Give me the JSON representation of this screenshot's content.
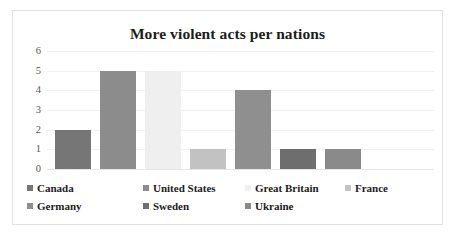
{
  "chart_data": {
    "type": "bar",
    "title": "More violent acts per nations",
    "xlabel": "",
    "ylabel": "",
    "categories": [
      "1"
    ],
    "xtick_labels": [
      "1"
    ],
    "ytick_labels": [
      "6",
      "5",
      "4",
      "3",
      "2",
      "1",
      "0"
    ],
    "ylim": [
      0,
      6
    ],
    "grid": true,
    "legend_position": "bottom",
    "series": [
      {
        "name": "Canada",
        "values": [
          2
        ],
        "color": "#767676"
      },
      {
        "name": "United States",
        "values": [
          5
        ],
        "color": "#8c8c8c"
      },
      {
        "name": "Great Britain",
        "values": [
          5
        ],
        "color": "#efefef"
      },
      {
        "name": "France",
        "values": [
          1
        ],
        "color": "#c2c2c2"
      },
      {
        "name": "Germany",
        "values": [
          4
        ],
        "color": "#8f8f8f"
      },
      {
        "name": "Sweden",
        "values": [
          1
        ],
        "color": "#6e6e6e"
      },
      {
        "name": "Ukraine",
        "values": [
          1
        ],
        "color": "#8a8a8a"
      }
    ]
  },
  "legend_rows": [
    [
      "Canada",
      "United States",
      "Great Britain",
      "France"
    ],
    [
      "Germany",
      "Sweden",
      "Ukraine"
    ]
  ]
}
